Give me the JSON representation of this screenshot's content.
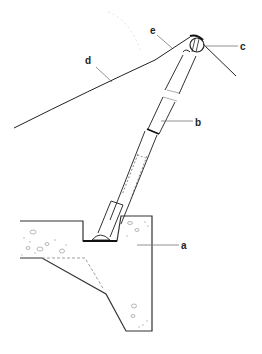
{
  "diagram": {
    "type": "technical-illustration",
    "labels": [
      {
        "id": "a",
        "text": "a",
        "target": "concrete foundation block"
      },
      {
        "id": "b",
        "text": "b",
        "target": "telescopic strut / mast"
      },
      {
        "id": "c",
        "text": "c",
        "target": "pulley head"
      },
      {
        "id": "d",
        "text": "d",
        "target": "cable (main span)"
      },
      {
        "id": "e",
        "text": "e",
        "target": "cable saddle / guide"
      }
    ],
    "colors": {
      "line": "#333333",
      "leader": "#777777",
      "background": "#ffffff"
    }
  }
}
